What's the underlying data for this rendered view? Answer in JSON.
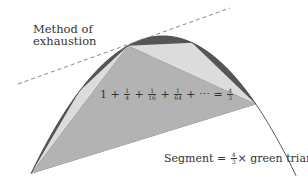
{
  "title_label": {
    "line1": "Method of",
    "line2": "exhaustion"
  },
  "series_label": {
    "lead": "1 + ",
    "terms": [
      {
        "num": "1",
        "den": "4"
      },
      {
        "num": "1",
        "den": "16"
      },
      {
        "num": "1",
        "den": "64"
      }
    ],
    "plus": " + ",
    "tail": " + ⋯ = ",
    "result": {
      "num": "4",
      "den": "3"
    }
  },
  "segment_label": {
    "prefix": "Segment = ",
    "factor": {
      "num": "4",
      "den": "3"
    },
    "suffix": "× green triangle"
  },
  "colors": {
    "main_triangle": "#b3b3b3",
    "secondary_triangles": "#dcdcdc",
    "slivers": "#555555",
    "parabola": "#444444",
    "tangent": "#888888",
    "text": "#333333"
  },
  "geometry": {
    "parabola": {
      "h": 163,
      "k": 36,
      "a": 0.0079,
      "x_start": 31,
      "x_end": 296
    },
    "vertices": {
      "A": [
        31,
        173
      ],
      "B": [
        128,
        42
      ],
      "C": [
        256,
        98
      ]
    },
    "tangent": {
      "from": [
        18,
        84
      ],
      "to": [
        230,
        8
      ]
    }
  }
}
